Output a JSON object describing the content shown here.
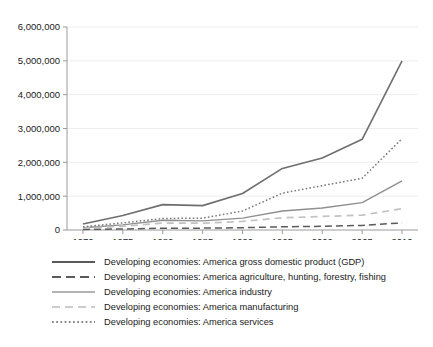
{
  "title_fragment": "",
  "chart_data": {
    "type": "line",
    "title": "",
    "xlabel": "",
    "ylabel": "",
    "x": [
      1970,
      1975,
      1980,
      1985,
      1990,
      1995,
      2000,
      2005,
      2010
    ],
    "xlim": [
      1968,
      2012
    ],
    "ylim": [
      0,
      6000000
    ],
    "ytick_labels": [
      "0",
      "1,000,000",
      "2,000,000",
      "3,000,000",
      "4,000,000",
      "5,000,000",
      "6,000,000"
    ],
    "ytick_values": [
      0,
      1000000,
      2000000,
      3000000,
      4000000,
      5000000,
      6000000
    ],
    "xtick_labels": [
      "1970",
      "1975",
      "1980",
      "1985",
      "1990",
      "1995",
      "2000",
      "2005",
      "2010"
    ],
    "grid": "horizontal",
    "legend_position": "below",
    "series": [
      {
        "name": "Developing economies: America gross domestic product (GDP)",
        "style": "solid",
        "color": "#6e6e6e",
        "width": 1.6,
        "values": [
          180000,
          430000,
          750000,
          720000,
          1080000,
          1820000,
          2130000,
          2680000,
          5000000
        ]
      },
      {
        "name": "Developing economies: America agriculture, hunting, forestry, fishing",
        "style": "dashed",
        "color": "#5a5a5a",
        "width": 1.5,
        "values": [
          18000,
          30000,
          52000,
          55000,
          68000,
          95000,
          110000,
          135000,
          210000
        ]
      },
      {
        "name": "Developing economies: America industry",
        "style": "solid",
        "color": "#8f8f8f",
        "width": 1.4,
        "values": [
          68000,
          150000,
          290000,
          270000,
          350000,
          560000,
          650000,
          810000,
          1450000
        ]
      },
      {
        "name": "Developing economies: America manufacturing",
        "style": "dashed-light",
        "color": "#c2c2c2",
        "width": 1.7,
        "values": [
          52000,
          110000,
          205000,
          200000,
          255000,
          360000,
          400000,
          440000,
          630000
        ]
      },
      {
        "name": "Developing economies: America services",
        "style": "dotted",
        "color": "#7a7a7a",
        "width": 1.5,
        "values": [
          95000,
          210000,
          340000,
          350000,
          560000,
          1090000,
          1310000,
          1530000,
          2700000
        ]
      }
    ]
  },
  "legend": {
    "items": [
      {
        "label": "Developing economies: America gross domestic product (GDP)",
        "style": "solid",
        "color": "#5a5a5a"
      },
      {
        "label": "Developing economies: America agriculture, hunting, forestry, fishing",
        "style": "dashed",
        "color": "#5a5a5a"
      },
      {
        "label": "Developing economies: America industry",
        "style": "solid-gray",
        "color": "#9a9a9a"
      },
      {
        "label": "Developing economies: America manufacturing",
        "style": "dashed-light",
        "color": "#cccccc"
      },
      {
        "label": "Developing economies: America services",
        "style": "dotted",
        "color": "#8a8a8a"
      }
    ]
  }
}
